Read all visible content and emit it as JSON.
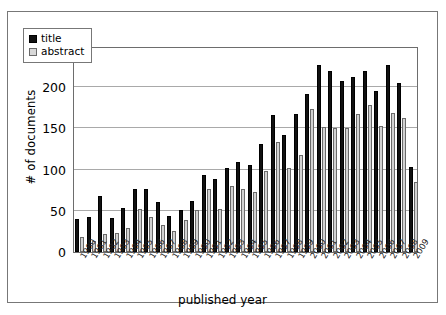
{
  "chart_data": {
    "type": "bar",
    "title": "",
    "xlabel": "published year",
    "ylabel": "# of documents",
    "ylim": [
      0,
      250
    ],
    "yticks": [
      0,
      50,
      100,
      150,
      200,
      250
    ],
    "grid": true,
    "legend_position": "top-left",
    "categories": [
      "1980",
      "1981",
      "1982",
      "1983",
      "1984",
      "1985",
      "1986",
      "1987",
      "1988",
      "1989",
      "1990",
      "1991",
      "1992",
      "1993",
      "1994",
      "1995",
      "1996",
      "1997",
      "1998",
      "1999",
      "2000",
      "2001",
      "2002",
      "2003",
      "2004",
      "2005",
      "2006",
      "2007",
      "2008",
      "2009"
    ],
    "series": [
      {
        "name": "title",
        "color": "#111111",
        "values": [
          40,
          43,
          68,
          41,
          54,
          77,
          76,
          61,
          44,
          51,
          62,
          93,
          89,
          102,
          109,
          105,
          131,
          166,
          142,
          167,
          192,
          227,
          220,
          207,
          212,
          220,
          196,
          227,
          205,
          103
        ]
      },
      {
        "name": "abstract",
        "color": "#d2d2d2",
        "values": [
          18,
          13,
          22,
          23,
          29,
          52,
          43,
          33,
          26,
          39,
          51,
          76,
          52,
          80,
          77,
          73,
          98,
          134,
          102,
          118,
          174,
          152,
          151,
          151,
          167,
          178,
          153,
          169,
          163,
          85
        ]
      }
    ]
  },
  "legend": {
    "items": [
      {
        "label": "title",
        "swatch": "legend-swatch-title"
      },
      {
        "label": "abstract",
        "swatch": "legend-swatch-abstract"
      }
    ]
  },
  "axes": {
    "y_title": "# of documents",
    "x_title": "published year"
  }
}
